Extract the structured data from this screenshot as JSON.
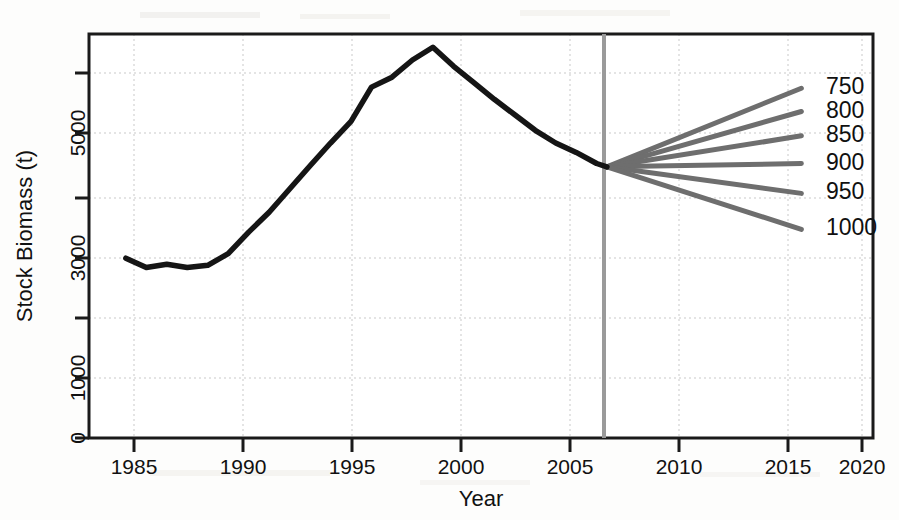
{
  "chart_data": {
    "type": "line",
    "title": "",
    "xlabel": "Year",
    "ylabel": "Stock Biomass (t)",
    "xlim": [
      1983.2,
      2021.5
    ],
    "ylim": [
      0,
      7300
    ],
    "xticks": [
      1985,
      1990,
      1995,
      2000,
      2005,
      2010,
      2015,
      2020
    ],
    "xtick_labels": [
      "1985",
      "1990",
      "1995",
      "2000",
      "2005",
      "2010",
      "2015",
      "2020"
    ],
    "yticks": [
      0,
      1000,
      2000,
      3000,
      4000,
      5000,
      6000
    ],
    "ytick_labels": [
      "0",
      "1000",
      "",
      "3000",
      "",
      "5000",
      ""
    ],
    "grid": true,
    "grid_style": "dotted",
    "legend_position": "right-inline",
    "reference_line": {
      "name": "projection-start",
      "x": 2008.5,
      "color": "#9a9a9a"
    },
    "series": [
      {
        "name": "Historical stock biomass",
        "color": "#151515",
        "x": [
          1985,
          1986,
          1987,
          1988,
          1989,
          1990,
          1991,
          1992,
          1993,
          1994,
          1995,
          1996,
          1997,
          1998,
          1999,
          2000,
          2001,
          2002,
          2003,
          2004,
          2005,
          2006,
          2007,
          2008,
          2008.5
        ],
        "values": [
          3250,
          3080,
          3140,
          3080,
          3120,
          3330,
          3720,
          4080,
          4500,
          4920,
          5330,
          5720,
          6340,
          6520,
          6830,
          7060,
          6720,
          6420,
          6120,
          5840,
          5560,
          5330,
          5160,
          4960,
          4900
        ]
      },
      {
        "name": "750",
        "color": "#6e6e6e",
        "x": [
          2008.5,
          2018
        ],
        "values": [
          4900,
          6320
        ]
      },
      {
        "name": "800",
        "color": "#6e6e6e",
        "x": [
          2008.5,
          2018
        ],
        "values": [
          4900,
          5900
        ]
      },
      {
        "name": "850",
        "color": "#6e6e6e",
        "x": [
          2008.5,
          2018
        ],
        "values": [
          4900,
          5460
        ]
      },
      {
        "name": "900",
        "color": "#6e6e6e",
        "x": [
          2008.5,
          2018
        ],
        "values": [
          4900,
          4960
        ]
      },
      {
        "name": "950",
        "color": "#6e6e6e",
        "x": [
          2008.5,
          2018
        ],
        "values": [
          4900,
          4420
        ]
      },
      {
        "name": "1000",
        "color": "#6e6e6e",
        "x": [
          2008.5,
          2018
        ],
        "values": [
          4900,
          3770
        ]
      }
    ],
    "annotations": [
      {
        "label": "750",
        "x": 2019.2,
        "y": 6320
      },
      {
        "label": "800",
        "x": 2019.2,
        "y": 5900
      },
      {
        "label": "850",
        "x": 2019.2,
        "y": 5460
      },
      {
        "label": "900",
        "x": 2019.2,
        "y": 4960
      },
      {
        "label": "950",
        "x": 2019.2,
        "y": 4420
      },
      {
        "label": "1000",
        "x": 2019.2,
        "y": 3770
      }
    ]
  },
  "axes": {
    "x_title": "Year",
    "y_title": "Stock Biomass (t)",
    "x_tick_labels": [
      "1985",
      "1990",
      "1995",
      "2000",
      "2005",
      "2010",
      "2015",
      "2020"
    ],
    "y_tick_labels": [
      "0",
      "1000",
      "3000",
      "5000"
    ]
  },
  "legend": {
    "items": [
      "750",
      "800",
      "850",
      "900",
      "950",
      "1000"
    ]
  },
  "colors": {
    "history_line": "#151515",
    "projection_line": "#6e6e6e",
    "reference_line": "#9a9a9a",
    "grid": "#c9c9c9",
    "axis": "#1a1a1a",
    "background": "#fdfdfc"
  }
}
